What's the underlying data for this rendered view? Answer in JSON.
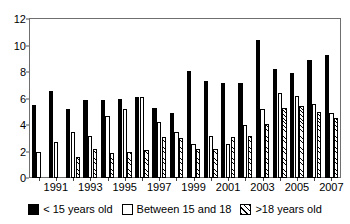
{
  "chart_data": {
    "type": "bar",
    "title": "",
    "subtitle": "",
    "xlabel": "",
    "ylabel": "",
    "ylim": [
      0,
      12
    ],
    "yticks": [
      0,
      2,
      4,
      6,
      8,
      10,
      12
    ],
    "grid": false,
    "legend_position": "bottom",
    "categories": [
      "1990",
      "1991",
      "1992",
      "1993",
      "1994",
      "1995",
      "1996",
      "1997",
      "1998",
      "1999",
      "2000",
      "2001",
      "2002",
      "2003",
      "2004",
      "2005",
      "2006",
      "2007"
    ],
    "xtick_labels": [
      "",
      "1991",
      "",
      "1993",
      "",
      "1995",
      "",
      "1997",
      "",
      "1999",
      "",
      "2001",
      "",
      "2003",
      "",
      "2005",
      "",
      "2007"
    ],
    "series": [
      {
        "name": "< 15 years old",
        "style": "solid-black",
        "color": "#000000",
        "values": [
          5.5,
          6.6,
          5.2,
          5.9,
          5.9,
          6.0,
          6.1,
          5.3,
          4.9,
          8.1,
          7.3,
          7.2,
          7.2,
          10.4,
          8.2,
          7.9,
          8.9,
          9.3
        ]
      },
      {
        "name": "Between 15 and 18",
        "style": "white-outline",
        "color": "#ffffff",
        "values": [
          2.0,
          2.7,
          3.5,
          3.2,
          4.7,
          5.2,
          6.1,
          4.2,
          3.5,
          2.6,
          3.2,
          2.6,
          4.0,
          5.2,
          6.4,
          6.2,
          5.6,
          4.9
        ]
      },
      {
        "name": ">18 years old",
        "style": "hatched",
        "color": "#ffffff",
        "values": [
          0.0,
          0.0,
          1.6,
          2.2,
          1.9,
          2.0,
          2.1,
          3.1,
          3.0,
          2.2,
          2.2,
          3.1,
          3.2,
          4.1,
          5.3,
          5.4,
          5.0,
          4.5
        ]
      }
    ],
    "legend_entries": [
      "< 15 years old",
      "Between 15 and 18",
      ">18 years old"
    ]
  }
}
